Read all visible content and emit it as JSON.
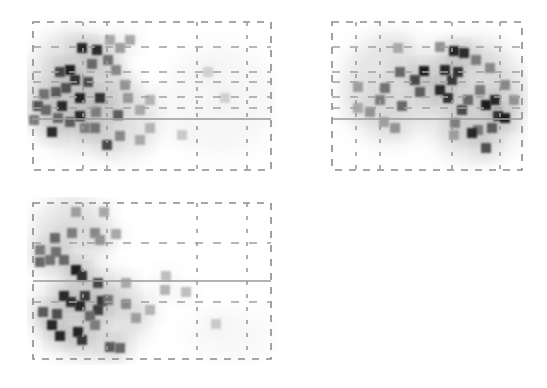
{
  "figure": {
    "type": "glass-brain-maximum-intensity-projection",
    "colormap": "grayscale (white = low, black = high)",
    "panels": [
      {
        "id": "sagittal",
        "box": {
          "x": 33,
          "y": 22,
          "w": 238,
          "h": 148
        },
        "crosshair_y": 119,
        "v_dash": [
          83,
          107,
          197,
          247
        ],
        "h_dash": [
          47,
          72,
          82,
          97,
          108
        ],
        "glow": [
          {
            "cx": 75,
            "cy": 90,
            "rx": 48,
            "ry": 60,
            "o": 0.55
          },
          {
            "cx": 120,
            "cy": 120,
            "rx": 40,
            "ry": 40,
            "o": 0.35
          },
          {
            "cx": 220,
            "cy": 100,
            "rx": 55,
            "ry": 55,
            "o": 0.15
          }
        ],
        "voxels": [
          [
            82,
            48,
            0.9
          ],
          [
            97,
            50,
            0.9
          ],
          [
            70,
            70,
            0.95
          ],
          [
            60,
            72,
            0.75
          ],
          [
            75,
            80,
            0.85
          ],
          [
            88,
            82,
            0.7
          ],
          [
            56,
            92,
            0.65
          ],
          [
            80,
            98,
            0.92
          ],
          [
            100,
            98,
            0.85
          ],
          [
            62,
            106,
            0.9
          ],
          [
            38,
            106,
            0.7
          ],
          [
            46,
            110,
            0.6
          ],
          [
            80,
            116,
            0.92
          ],
          [
            34,
            120,
            0.5
          ],
          [
            52,
            132,
            0.88
          ],
          [
            107,
            145,
            0.75
          ],
          [
            118,
            115,
            0.65
          ],
          [
            95,
            128,
            0.55
          ],
          [
            116,
            70,
            0.45
          ],
          [
            125,
            85,
            0.4
          ],
          [
            128,
            98,
            0.38
          ],
          [
            120,
            136,
            0.45
          ],
          [
            85,
            128,
            0.5
          ],
          [
            140,
            110,
            0.3
          ],
          [
            130,
            40,
            0.3
          ],
          [
            120,
            48,
            0.35
          ],
          [
            108,
            60,
            0.55
          ],
          [
            92,
            64,
            0.6
          ],
          [
            66,
            88,
            0.7
          ],
          [
            44,
            94,
            0.55
          ],
          [
            58,
            118,
            0.6
          ],
          [
            70,
            122,
            0.65
          ],
          [
            96,
            112,
            0.5
          ],
          [
            140,
            140,
            0.3
          ],
          [
            150,
            128,
            0.25
          ],
          [
            110,
            40,
            0.3
          ],
          [
            150,
            100,
            0.25
          ],
          [
            182,
            135,
            0.15
          ],
          [
            208,
            72,
            0.12
          ],
          [
            225,
            98,
            0.12
          ]
        ]
      },
      {
        "id": "coronal",
        "box": {
          "x": 332,
          "y": 22,
          "w": 190,
          "h": 148
        },
        "crosshair_y": 119,
        "v_dash": [
          356,
          380,
          452,
          500
        ],
        "h_dash": [
          47,
          72,
          82,
          97,
          108
        ],
        "glow": [
          {
            "cx": 390,
            "cy": 88,
            "rx": 48,
            "ry": 55,
            "o": 0.45
          },
          {
            "cx": 475,
            "cy": 100,
            "rx": 52,
            "ry": 62,
            "o": 0.5
          }
        ],
        "voxels": [
          [
            424,
            71,
            0.95
          ],
          [
            415,
            80,
            0.75
          ],
          [
            400,
            72,
            0.6
          ],
          [
            385,
            88,
            0.55
          ],
          [
            420,
            92,
            0.65
          ],
          [
            402,
            106,
            0.6
          ],
          [
            380,
            100,
            0.5
          ],
          [
            370,
            112,
            0.4
          ],
          [
            358,
            87,
            0.35
          ],
          [
            395,
            128,
            0.4
          ],
          [
            384,
            122,
            0.35
          ],
          [
            454,
            51,
            0.92
          ],
          [
            464,
            53,
            0.88
          ],
          [
            445,
            70,
            0.9
          ],
          [
            458,
            72,
            0.85
          ],
          [
            452,
            80,
            0.8
          ],
          [
            440,
            90,
            0.88
          ],
          [
            448,
            98,
            0.85
          ],
          [
            462,
            110,
            0.75
          ],
          [
            476,
            60,
            0.5
          ],
          [
            490,
            68,
            0.45
          ],
          [
            480,
            90,
            0.5
          ],
          [
            486,
            105,
            0.95
          ],
          [
            495,
            100,
            0.9
          ],
          [
            498,
            116,
            0.85
          ],
          [
            505,
            118,
            0.95
          ],
          [
            492,
            128,
            0.65
          ],
          [
            478,
            130,
            0.5
          ],
          [
            472,
            133,
            0.9
          ],
          [
            486,
            148,
            0.7
          ],
          [
            468,
            100,
            0.6
          ],
          [
            455,
            123,
            0.5
          ],
          [
            514,
            100,
            0.4
          ],
          [
            505,
            85,
            0.45
          ],
          [
            440,
            47,
            0.4
          ],
          [
            454,
            135,
            0.35
          ],
          [
            358,
            108,
            0.3
          ],
          [
            398,
            48,
            0.3
          ]
        ]
      },
      {
        "id": "axial",
        "box": {
          "x": 33,
          "y": 203,
          "w": 238,
          "h": 156
        },
        "crosshair_y": 281,
        "v_dash": [
          83,
          107,
          197,
          247
        ],
        "h_dash": [
          243,
          302
        ],
        "glow": [
          {
            "cx": 70,
            "cy": 235,
            "rx": 38,
            "ry": 40,
            "o": 0.45
          },
          {
            "cx": 90,
            "cy": 315,
            "rx": 58,
            "ry": 45,
            "o": 0.5
          },
          {
            "cx": 230,
            "cy": 335,
            "rx": 45,
            "ry": 25,
            "o": 0.12
          }
        ],
        "voxels": [
          [
            76,
            270,
            0.95
          ],
          [
            82,
            276,
            0.85
          ],
          [
            98,
            283,
            0.75
          ],
          [
            64,
            296,
            0.88
          ],
          [
            71,
            302,
            0.85
          ],
          [
            85,
            296,
            0.8
          ],
          [
            102,
            301,
            0.85
          ],
          [
            98,
            310,
            0.82
          ],
          [
            80,
            306,
            0.9
          ],
          [
            43,
            312,
            0.65
          ],
          [
            57,
            314,
            0.7
          ],
          [
            52,
            325,
            0.88
          ],
          [
            60,
            336,
            0.9
          ],
          [
            78,
            332,
            0.92
          ],
          [
            82,
            340,
            0.82
          ],
          [
            90,
            316,
            0.6
          ],
          [
            110,
            347,
            0.65
          ],
          [
            120,
            348,
            0.6
          ],
          [
            95,
            325,
            0.5
          ],
          [
            108,
            300,
            0.55
          ],
          [
            126,
            304,
            0.45
          ],
          [
            136,
            318,
            0.35
          ],
          [
            40,
            262,
            0.6
          ],
          [
            50,
            260,
            0.55
          ],
          [
            56,
            252,
            0.55
          ],
          [
            64,
            260,
            0.6
          ],
          [
            40,
            250,
            0.5
          ],
          [
            55,
            238,
            0.6
          ],
          [
            72,
            233,
            0.5
          ],
          [
            95,
            233,
            0.45
          ],
          [
            100,
            240,
            0.4
          ],
          [
            76,
            212,
            0.35
          ],
          [
            104,
            212,
            0.3
          ],
          [
            116,
            234,
            0.3
          ],
          [
            126,
            283,
            0.3
          ],
          [
            150,
            310,
            0.25
          ],
          [
            166,
            276,
            0.2
          ],
          [
            165,
            290,
            0.25
          ],
          [
            186,
            292,
            0.2
          ],
          [
            216,
            324,
            0.15
          ]
        ]
      }
    ]
  }
}
